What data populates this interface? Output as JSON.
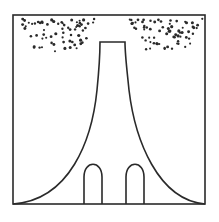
{
  "figure": {
    "colors": {
      "background": "#ffffff",
      "stroke": "#2a2a2a",
      "dots": "#2a2a2a"
    },
    "frame": {
      "x": 13,
      "y": 15,
      "width": 192,
      "height": 189
    },
    "stem": {
      "top_y": 42,
      "top_left_x": 100,
      "top_right_x": 125,
      "base_y": 204,
      "base_left_x": 13,
      "base_right_x": 205
    },
    "arches": [
      {
        "name": "left-arch",
        "x1": 84,
        "x2": 102,
        "top_y": 163,
        "base_y": 204
      },
      {
        "name": "right-arch",
        "x1": 126,
        "x2": 144,
        "top_y": 163,
        "base_y": 204
      }
    ],
    "dot_clusters": [
      {
        "name": "left-dot-cluster",
        "region": [
          20,
          18,
          95,
          52
        ]
      },
      {
        "name": "right-dot-cluster",
        "region": [
          128,
          18,
          203,
          50
        ]
      }
    ]
  }
}
